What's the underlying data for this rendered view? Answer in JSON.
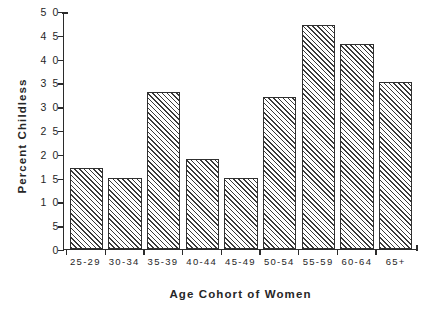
{
  "chart_data": {
    "type": "bar",
    "title": "",
    "xlabel": "Age Cohort of Women",
    "ylabel": "Percent Childless",
    "categories": [
      "25-29",
      "30-34",
      "35-39",
      "40-44",
      "45-49",
      "50-54",
      "55-59",
      "60-64",
      "65+"
    ],
    "values": [
      17,
      15,
      33,
      19,
      15,
      32,
      47,
      43,
      35
    ],
    "ylim": [
      0,
      50
    ],
    "yticks": [
      0,
      5,
      10,
      15,
      20,
      25,
      30,
      35,
      40,
      45,
      50
    ],
    "ytick_labels": [
      "0",
      "5",
      "1 0",
      "1 5",
      "2 0",
      "2 5",
      "3 0",
      "3 5",
      "4 0",
      "4 5",
      "5 0"
    ],
    "grid": false,
    "legend": false,
    "bar_fill": "hatch-diagonal-45",
    "bar_edge_color": "#303030",
    "axis_color": "#2b2b2b",
    "background": "#ffffff"
  }
}
